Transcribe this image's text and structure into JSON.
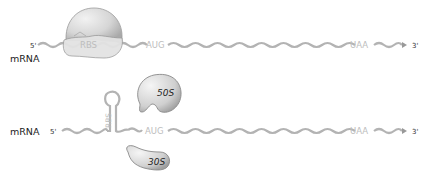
{
  "panel_top": {
    "molecule_label": "mRNA",
    "five_prime": "5'",
    "three_prime": "3'",
    "rbs_label": "RBS",
    "start_codon": "AUG",
    "stop_codon": "UAA",
    "state": "ribosome bound at RBS"
  },
  "panel_bottom": {
    "molecule_label": "mRNA",
    "five_prime": "5'",
    "three_prime": "3'",
    "rbs_label": "RBS",
    "start_codon": "AUG",
    "stop_codon": "UAA",
    "large_subunit": "50S",
    "small_subunit": "30S",
    "state": "RBS sequestered in hairpin; subunits unbound"
  },
  "colors": {
    "strand": "#b3b3b3",
    "label_gray": "#bdbdbd",
    "ribosome_fill_light": "#e6e6e6",
    "ribosome_fill_dark": "#bfbfbf",
    "ribosome_stroke": "#8a8a8a",
    "text_dark": "#222222"
  }
}
